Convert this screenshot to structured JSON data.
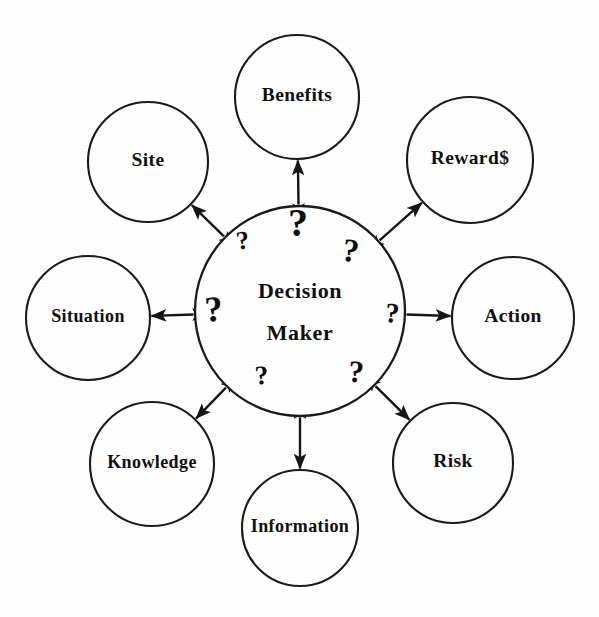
{
  "figure": {
    "kind": "radial-hub-and-spoke-diagram",
    "center": {
      "id": "decision-maker",
      "label_line1": "Decision",
      "label_line2": "Maker",
      "cx": 300,
      "cy": 311,
      "r": 105
    },
    "question_marks": [
      {
        "id": "q-top",
        "glyph": "?",
        "x": 298,
        "y": 227,
        "size": 40,
        "rotate": 0
      },
      {
        "id": "q-upper-left",
        "glyph": "?",
        "x": 243,
        "y": 243,
        "size": 26,
        "rotate": -8
      },
      {
        "id": "q-upper-right",
        "glyph": "?",
        "x": 350,
        "y": 254,
        "size": 33,
        "rotate": 9
      },
      {
        "id": "q-left",
        "glyph": "?",
        "x": 214,
        "y": 313,
        "size": 36,
        "rotate": -4
      },
      {
        "id": "q-right",
        "glyph": "?",
        "x": 392,
        "y": 316,
        "size": 28,
        "rotate": 5
      },
      {
        "id": "q-lower-left",
        "glyph": "?",
        "x": 262,
        "y": 378,
        "size": 27,
        "rotate": -5
      },
      {
        "id": "q-lower-right",
        "glyph": "?",
        "x": 356,
        "y": 375,
        "size": 31,
        "rotate": 4
      }
    ],
    "nodes": [
      {
        "id": "benefits",
        "label": "Benefits",
        "cx": 297,
        "cy": 97,
        "r": 62,
        "arrow": "bidirectional",
        "angle_deg": 270
      },
      {
        "id": "site",
        "label": "Site",
        "cx": 148,
        "cy": 162,
        "r": 60,
        "arrow": "bidirectional",
        "angle_deg": 224
      },
      {
        "id": "rewards",
        "label": "Reward$",
        "cx": 470,
        "cy": 160,
        "r": 63,
        "arrow": "bidirectional",
        "angle_deg": 317
      },
      {
        "id": "situation",
        "label": "Situation",
        "cx": 88,
        "cy": 318,
        "r": 62,
        "arrow": "bidirectional",
        "angle_deg": 180
      },
      {
        "id": "action",
        "label": "Action",
        "cx": 513,
        "cy": 318,
        "r": 61,
        "arrow": "outward",
        "angle_deg": 0
      },
      {
        "id": "knowledge",
        "label": "Knowledge",
        "cx": 152,
        "cy": 464,
        "r": 62,
        "arrow": "bidirectional",
        "angle_deg": 136
      },
      {
        "id": "information",
        "label": "Information",
        "cx": 300,
        "cy": 528,
        "r": 58,
        "arrow": "bidirectional",
        "angle_deg": 90
      },
      {
        "id": "risk",
        "label": "Risk",
        "cx": 453,
        "cy": 463,
        "r": 60,
        "arrow": "bidirectional",
        "angle_deg": 44
      }
    ],
    "colors": {
      "stroke": "#1a1a1a",
      "text": "#101010",
      "background": "#ffffff"
    }
  }
}
